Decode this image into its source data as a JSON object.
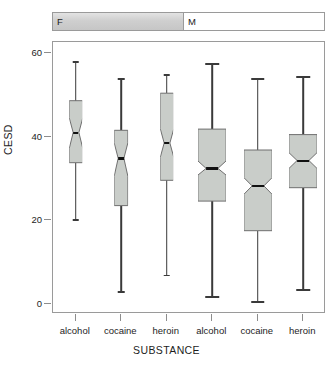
{
  "strip": {
    "cells": [
      {
        "label": "F",
        "shaded": true
      },
      {
        "label": "M",
        "shaded": false
      }
    ]
  },
  "axes": {
    "ytitle": "CESD",
    "xtitle": "SUBSTANCE",
    "yticks": [
      "0",
      "20",
      "40",
      "60"
    ],
    "xticklabels": [
      "alcohol",
      "cocaine",
      "heroin",
      "alcohol",
      "cocaine",
      "heroin"
    ]
  },
  "colors": {
    "box_fill": "#c9cdc9",
    "box_border": "#6f6f6f",
    "whisker": "#3a3a3a",
    "median": "#111111",
    "frame": "#9a9a9a",
    "strip_shaded": "#cfcfcf",
    "text": "#1d1d1d"
  },
  "chart_data": {
    "type": "box",
    "title": "",
    "subtitle": "",
    "xlabel": "SUBSTANCE",
    "ylabel": "CESD",
    "ylim": [
      0,
      60
    ],
    "yticks": [
      0,
      20,
      40,
      60
    ],
    "grid": false,
    "legend": "none",
    "notched": true,
    "panel_variable": "SEX",
    "panels": [
      "F",
      "M"
    ],
    "categories": [
      "alcohol",
      "cocaine",
      "heroin",
      "alcohol",
      "cocaine",
      "heroin"
    ],
    "boxes": [
      {
        "panel": "F",
        "substance": "alcohol",
        "whisker_low": 20.3,
        "q1": 33.7,
        "median": 40.9,
        "q3": 48.5,
        "whisker_high": 58.0,
        "notch_low": 37.0,
        "notch_high": 44.5,
        "box_width": 0.3
      },
      {
        "panel": "F",
        "substance": "cocaine",
        "whisker_low": 3.0,
        "q1": 23.5,
        "median": 34.8,
        "q3": 41.5,
        "whisker_high": 54.0,
        "notch_low": 30.5,
        "notch_high": 38.5,
        "box_width": 0.3
      },
      {
        "panel": "F",
        "substance": "heroin",
        "whisker_low": 7.0,
        "q1": 29.6,
        "median": 38.5,
        "q3": 50.4,
        "whisker_high": 55.0,
        "notch_low": 35.0,
        "notch_high": 42.0,
        "box_width": 0.3
      },
      {
        "panel": "M",
        "substance": "alcohol",
        "whisker_low": 1.9,
        "q1": 24.6,
        "median": 32.4,
        "q3": 41.8,
        "whisker_high": 57.6,
        "notch_low": 30.8,
        "notch_high": 34.2,
        "box_width": 0.62
      },
      {
        "panel": "M",
        "substance": "cocaine",
        "whisker_low": 0.7,
        "q1": 17.5,
        "median": 28.2,
        "q3": 36.8,
        "whisker_high": 54.0,
        "notch_low": 26.2,
        "notch_high": 30.2,
        "box_width": 0.62
      },
      {
        "panel": "M",
        "substance": "heroin",
        "whisker_low": 3.6,
        "q1": 27.8,
        "median": 34.3,
        "q3": 40.5,
        "whisker_high": 54.5,
        "notch_low": 32.4,
        "notch_high": 36.2,
        "box_width": 0.62
      }
    ]
  }
}
